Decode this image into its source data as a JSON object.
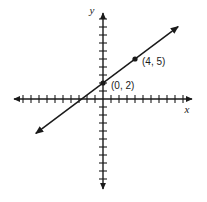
{
  "figure": {
    "width": 207,
    "height": 202,
    "background_color": "#ffffff",
    "ink_color": "#1a1a1a"
  },
  "axes": {
    "x_axis_label": "x",
    "y_axis_label": "y",
    "origin_px": {
      "x": 103,
      "y": 99
    },
    "unit_px": 8,
    "tick_half_length_px": 4,
    "x_axis": {
      "start_px": 14,
      "end_px": 192,
      "ticks_negative": 11,
      "ticks_positive": 10,
      "arrow_both_ends": true
    },
    "y_axis": {
      "start_px": 13,
      "end_px": 189,
      "ticks_positive": 10,
      "ticks_negative": 11,
      "arrow_both_ends": true
    }
  },
  "chart_data": {
    "type": "line",
    "title": "",
    "xlabel": "x",
    "ylabel": "y",
    "grid": false,
    "legend": "none",
    "xlim": [
      -11,
      11
    ],
    "ylim": [
      -11,
      11
    ],
    "xticks": [
      -11,
      -10,
      -9,
      -8,
      -7,
      -6,
      -5,
      -4,
      -3,
      -2,
      -1,
      0,
      1,
      2,
      3,
      4,
      5,
      6,
      7,
      8,
      9,
      10
    ],
    "yticks": [
      -11,
      -10,
      -9,
      -8,
      -7,
      -6,
      -5,
      -4,
      -3,
      -2,
      -1,
      0,
      1,
      2,
      3,
      4,
      5,
      6,
      7,
      8,
      9,
      10
    ],
    "tick_labels_shown": false,
    "series": [
      {
        "name": "line",
        "kind": "infinite-line",
        "slope": 0.75,
        "intercept": 2,
        "equation": "y = (3/4)x + 2",
        "arrow_both_ends": true,
        "x_range_drawn": [
          -8.4,
          9.4
        ],
        "points": [
          {
            "label": "(0, 2)",
            "x": 0,
            "y": 2,
            "marker": "filled-dot",
            "label_offset_px": {
              "x": 8,
              "y": 6
            }
          },
          {
            "label": "(4, 5)",
            "x": 4,
            "y": 5,
            "marker": "filled-dot",
            "label_offset_px": {
              "x": 7,
              "y": 6
            }
          }
        ]
      }
    ]
  },
  "annotations": {
    "point_label_1": "(0, 2)",
    "point_label_2": "(4, 5)"
  }
}
